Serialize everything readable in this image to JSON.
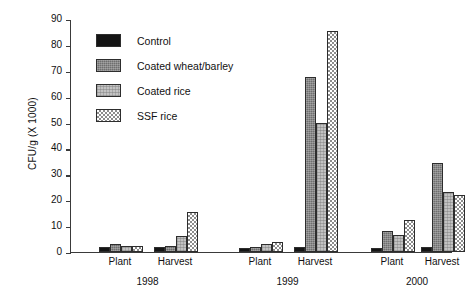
{
  "chart_data": {
    "type": "bar",
    "title": "",
    "xlabel": "",
    "ylabel": "CFU/g (X 1000)",
    "ylim": [
      0,
      90
    ],
    "ytick_values": [
      0,
      10,
      20,
      30,
      40,
      50,
      60,
      70,
      80,
      90
    ],
    "ytick_labels": [
      "0",
      "10",
      "20",
      "30",
      "40",
      "50",
      "60",
      "70",
      "80",
      "90"
    ],
    "grid": false,
    "legend_position": "upper-left-inside",
    "categories": [
      "1998 Plant",
      "1998 Harvest",
      "1999 Plant",
      "1999 Harvest",
      "2000 Plant",
      "2000 Harvest"
    ],
    "group_labels": [
      "1998",
      "1999",
      "2000"
    ],
    "sub_labels": [
      "Plant",
      "Harvest",
      "Plant",
      "Harvest",
      "Plant",
      "Harvest"
    ],
    "series": [
      {
        "name": "Control",
        "fill": "solid-black",
        "color": "#141414",
        "values": [
          2.0,
          2.0,
          1.5,
          2.0,
          1.5,
          2.0
        ]
      },
      {
        "name": "Coated wheat/barley",
        "fill": "dark-gray-stipple",
        "color": "#6e6e6e",
        "values": [
          3.0,
          2.5,
          2.0,
          67.5,
          8.0,
          34.5
        ]
      },
      {
        "name": "Coated rice",
        "fill": "light-gray-stipple",
        "color": "#c2c2c2",
        "values": [
          2.5,
          6.0,
          3.0,
          50.0,
          6.5,
          23.0
        ]
      },
      {
        "name": "SSF rice",
        "fill": "checkered",
        "color": "#8d8d8d",
        "values": [
          2.5,
          15.5,
          4.0,
          85.5,
          12.5,
          22.0
        ]
      }
    ]
  },
  "legend": {
    "items": [
      {
        "label": "Control"
      },
      {
        "label": "Coated wheat/barley"
      },
      {
        "label": "Coated rice"
      },
      {
        "label": "SSF rice"
      }
    ]
  }
}
